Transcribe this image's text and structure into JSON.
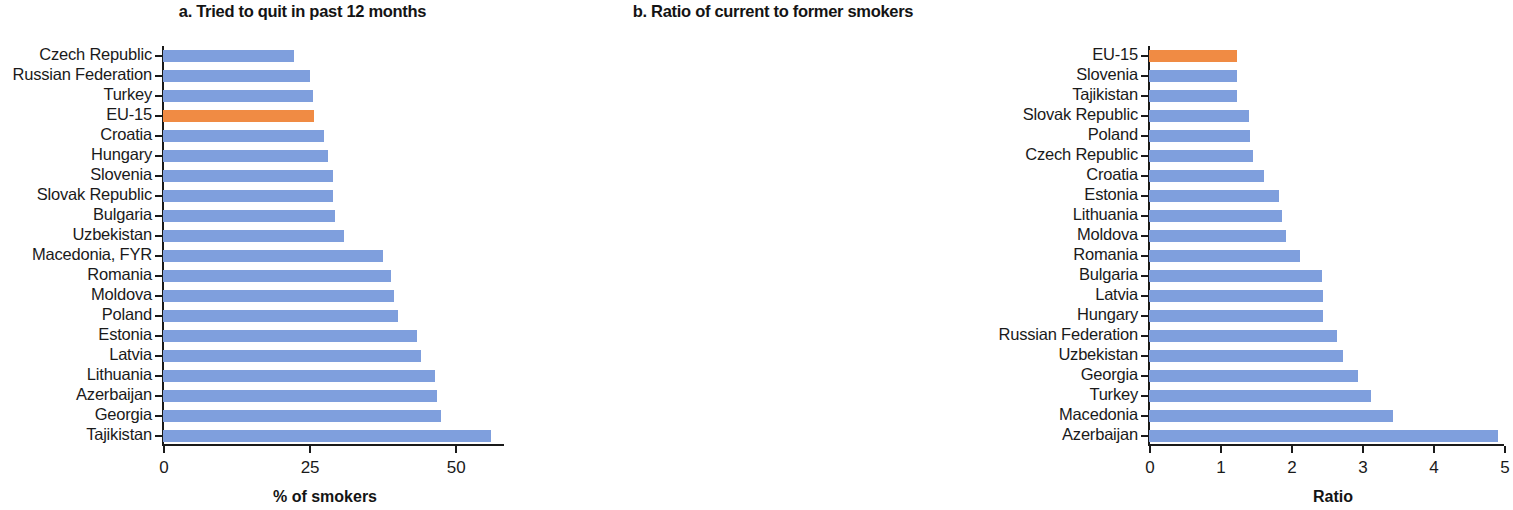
{
  "figure": {
    "background": "#ffffff",
    "bar_color_default": "#7f9fdd",
    "bar_color_highlight": "#f08b44",
    "highlight_label": "EU-15"
  },
  "chart_data": [
    {
      "type": "bar",
      "orientation": "horizontal",
      "panel": "a",
      "title": "a. Tried to quit in past 12 months",
      "xlabel": "% of smokers",
      "ylabel": "",
      "xlim": [
        0,
        58
      ],
      "xticks": [
        0,
        25,
        50
      ],
      "xticklabels": [
        "0",
        "25",
        "50"
      ],
      "grid": false,
      "legend": "none",
      "highlight": [
        "EU-15"
      ],
      "categories": [
        "Czech Republic",
        "Russian Federation",
        "Turkey",
        "EU-15",
        "Croatia",
        "Hungary",
        "Slovenia",
        "Slovak Republic",
        "Bulgaria",
        "Uzbekistan",
        "Macedonia, FYR",
        "Romania",
        "Moldova",
        "Poland",
        "Estonia",
        "Latvia",
        "Lithuania",
        "Azerbaijan",
        "Georgia",
        "Tajikistan"
      ],
      "values": [
        22.4,
        25.2,
        25.6,
        25.8,
        27.5,
        28.2,
        29.1,
        29.1,
        29.4,
        30.9,
        37.6,
        39.0,
        39.5,
        40.2,
        43.4,
        44.1,
        46.5,
        46.8,
        47.5,
        56.1
      ]
    },
    {
      "type": "bar",
      "orientation": "horizontal",
      "panel": "b",
      "title": "b. Ratio of current to former smokers",
      "xlabel": "Ratio",
      "ylabel": "",
      "xlim": [
        0,
        5
      ],
      "xticks": [
        0,
        1,
        2,
        3,
        4,
        5
      ],
      "xticklabels": [
        "0",
        "1",
        "2",
        "3",
        "4",
        "5"
      ],
      "grid": false,
      "legend": "none",
      "highlight": [
        "EU-15"
      ],
      "categories": [
        "EU-15",
        "Slovenia",
        "Tajikistan",
        "Slovak Republic",
        "Poland",
        "Czech Republic",
        "Croatia",
        "Estonia",
        "Lithuania",
        "Moldova",
        "Romania",
        "Bulgaria",
        "Latvia",
        "Hungary",
        "Russian Federation",
        "Uzbekistan",
        "Georgia",
        "Turkey",
        "Macedonia",
        "Azerbaijan"
      ],
      "values": [
        1.24,
        1.24,
        1.24,
        1.41,
        1.42,
        1.46,
        1.62,
        1.83,
        1.87,
        1.93,
        2.13,
        2.44,
        2.45,
        2.45,
        2.65,
        2.73,
        2.94,
        3.13,
        3.44,
        4.92
      ]
    }
  ]
}
